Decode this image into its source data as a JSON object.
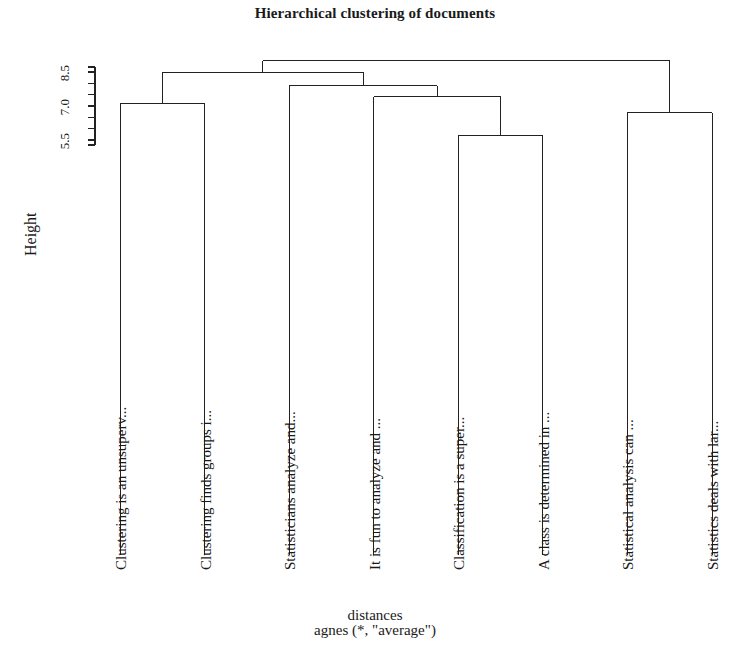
{
  "title": "Hierarchical clustering of documents",
  "axis": {
    "y_title": "Height",
    "y_tick_labels": [
      "5.5",
      "7.0",
      "8.5"
    ],
    "y_tick_values": [
      5.5,
      7.0,
      8.5
    ],
    "y_minor_tick_values": [
      5.5,
      6.0,
      6.5,
      7.0,
      7.5,
      8.0,
      8.5
    ],
    "x_label_line1": "distances",
    "x_label_line2": "agnes (*, \"average\")"
  },
  "leaves": [
    {
      "label": "Clustering is an unsuperv..."
    },
    {
      "label": "Clustering finds groups i..."
    },
    {
      "label": "Statisticians analyze and..."
    },
    {
      "label": "It is fun to analyze and ..."
    },
    {
      "label": "Classification is a super..."
    },
    {
      "label": "A class is determined in ..."
    },
    {
      "label": "Statistical analysis can ..."
    },
    {
      "label": "Statistics deals with lar..."
    }
  ],
  "style": {
    "line_color": "#222222",
    "background": "#ffffff",
    "line_width": 1
  },
  "chart_data": {
    "type": "dendrogram",
    "title": "Hierarchical clustering of documents",
    "xlabel": "distances",
    "sublabel": "agnes (*, \"average\")",
    "ylabel": "Height",
    "ylim": [
      4.6,
      9.2
    ],
    "yticks": [
      5.5,
      7.0,
      8.5
    ],
    "grid": false,
    "legend": null,
    "leaf_order": [
      "Clustering is an unsuperv...",
      "Clustering finds groups i...",
      "Statisticians analyze and...",
      "It is fun to analyze and ...",
      "Classification is a super...",
      "A class is determined in ...",
      "Statistical analysis can ...",
      "Statistics deals with lar..."
    ],
    "merges": [
      {
        "id": "A",
        "children": [
          "leaf0",
          "leaf1"
        ],
        "height": 7.1
      },
      {
        "id": "B",
        "children": [
          "leaf4",
          "leaf5"
        ],
        "height": 5.7
      },
      {
        "id": "C",
        "children": [
          "leaf6",
          "leaf7"
        ],
        "height": 6.7
      },
      {
        "id": "D",
        "children": [
          "leaf3",
          "B"
        ],
        "height": 7.4
      },
      {
        "id": "E",
        "children": [
          "leaf2",
          "D"
        ],
        "height": 7.9
      },
      {
        "id": "F",
        "children": [
          "A",
          "E"
        ],
        "height": 8.5
      },
      {
        "id": "ROOT",
        "children": [
          "F",
          "C"
        ],
        "height": 9.0
      }
    ]
  }
}
